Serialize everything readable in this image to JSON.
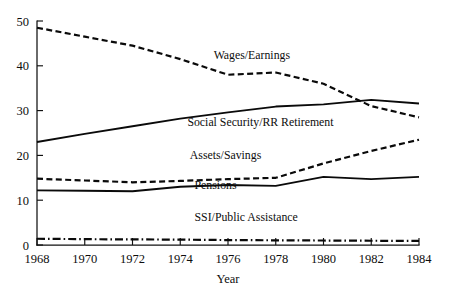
{
  "chart_data": {
    "type": "line",
    "title": "",
    "xlabel": "Year",
    "ylabel": "",
    "x": [
      1968,
      1970,
      1972,
      1974,
      1976,
      1978,
      1980,
      1982,
      1984
    ],
    "xlim": [
      1968,
      1984
    ],
    "ylim": [
      0,
      50
    ],
    "xticks": [
      1968,
      1970,
      1972,
      1974,
      1976,
      1978,
      1980,
      1982,
      1984
    ],
    "yticks": [
      0,
      10,
      20,
      30,
      40,
      50
    ],
    "grid": false,
    "legend": "inline-labels",
    "series": [
      {
        "name": "Wages/Earnings",
        "linestyle": "dashed",
        "color": "#0a0a0a",
        "values": [
          48.5,
          46.5,
          44.5,
          41.5,
          38.0,
          38.5,
          36.0,
          31.0,
          28.5
        ],
        "label_x": 1975.4,
        "label_y": 41.6
      },
      {
        "name": "Social Security/RR Retirement",
        "linestyle": "solid",
        "color": "#0a0a0a",
        "values": [
          23.0,
          24.8,
          26.5,
          28.2,
          29.6,
          30.9,
          31.4,
          32.4,
          31.6
        ],
        "label_x": 1974.3,
        "label_y": 26.6
      },
      {
        "name": "Assets/Savings",
        "linestyle": "dashed",
        "color": "#0a0a0a",
        "values": [
          14.8,
          14.4,
          14.0,
          14.3,
          14.7,
          15.0,
          18.2,
          21.0,
          23.5
        ],
        "label_x": 1974.4,
        "label_y": 19.1
      },
      {
        "name": "Pensions",
        "linestyle": "solid",
        "color": "#0a0a0a",
        "values": [
          12.2,
          12.1,
          12.0,
          13.0,
          13.4,
          13.2,
          15.2,
          14.7,
          15.2
        ],
        "label_x": 1974.6,
        "label_y": 12.5
      },
      {
        "name": "SSI/Public Assistance",
        "linestyle": "dashdot",
        "color": "#0a0a0a",
        "values": [
          1.4,
          1.3,
          1.25,
          1.2,
          1.1,
          1.05,
          1.0,
          0.95,
          0.9
        ],
        "label_x": 1974.6,
        "label_y": 5.3
      }
    ]
  },
  "axes": {
    "y_tick_labels": [
      "0",
      "10",
      "20",
      "30",
      "40",
      "50"
    ],
    "x_tick_labels": [
      "1968",
      "1970",
      "1972",
      "1974",
      "1976",
      "1978",
      "1980",
      "1982",
      "1984"
    ],
    "x_axis_title": "Year"
  }
}
